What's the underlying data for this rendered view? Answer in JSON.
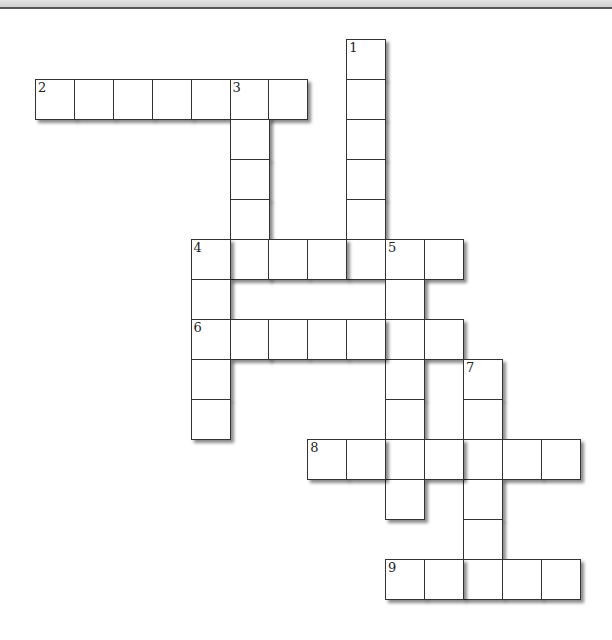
{
  "puzzle": {
    "type": "crossword",
    "grid": {
      "origin_x": 35,
      "origin_y": 39,
      "cell_w": 38.9,
      "cell_h": 40
    },
    "entries": [
      {
        "number": "1",
        "direction": "down",
        "row": 0,
        "col": 8,
        "length": 6
      },
      {
        "number": "2",
        "direction": "across",
        "row": 1,
        "col": 0,
        "length": 7
      },
      {
        "number": "3",
        "direction": "down",
        "row": 1,
        "col": 5,
        "length": 5
      },
      {
        "number": "4",
        "direction": "across",
        "row": 5,
        "col": 4,
        "length": 7
      },
      {
        "number": "4",
        "direction": "down",
        "row": 5,
        "col": 4,
        "length": 5
      },
      {
        "number": "5",
        "direction": "down",
        "row": 5,
        "col": 9,
        "length": 7
      },
      {
        "number": "6",
        "direction": "across",
        "row": 7,
        "col": 4,
        "length": 7
      },
      {
        "number": "7",
        "direction": "down",
        "row": 8,
        "col": 11,
        "length": 6
      },
      {
        "number": "8",
        "direction": "across",
        "row": 10,
        "col": 7,
        "length": 7
      },
      {
        "number": "9",
        "direction": "across",
        "row": 13,
        "col": 9,
        "length": 5
      }
    ]
  }
}
